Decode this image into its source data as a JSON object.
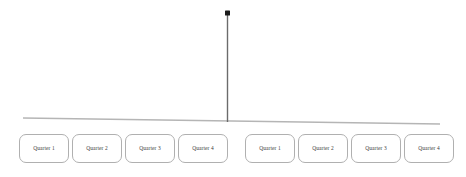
{
  "diagram": {
    "type": "timeline-hierarchy",
    "canvas": {
      "width": 466,
      "height": 177,
      "background": "#ffffff"
    },
    "root_marker": {
      "name": "root-node-marker",
      "shape": "square-dot",
      "color": "#1a1a1a",
      "x": 227.5,
      "y": 13,
      "size": 5
    },
    "stem": {
      "name": "vertical-connector",
      "color": "#6b6b6b",
      "width": 1.4,
      "x": 227.5,
      "y_top": 14,
      "y_bottom": 122
    },
    "baseline": {
      "name": "horizontal-baseline",
      "color": "#b5b5b5",
      "width": 1.4,
      "x_start": 23,
      "y_start": 118,
      "x_end": 440,
      "y_end": 124
    },
    "groups": [
      {
        "name": "left-quarter-group",
        "nodes": [
          {
            "label": "Quarter 1",
            "x": 19,
            "y": 134,
            "w": 50,
            "h": 29
          },
          {
            "label": "Quarter 2",
            "x": 72,
            "y": 134,
            "w": 50,
            "h": 29
          },
          {
            "label": "Quarter 3",
            "x": 125,
            "y": 134,
            "w": 50,
            "h": 29
          },
          {
            "label": "Quarter 4",
            "x": 178,
            "y": 134,
            "w": 50,
            "h": 29
          }
        ]
      },
      {
        "name": "right-quarter-group",
        "nodes": [
          {
            "label": "Quarter 1",
            "x": 245,
            "y": 134,
            "w": 50,
            "h": 29
          },
          {
            "label": "Quarter 2",
            "x": 298,
            "y": 134,
            "w": 50,
            "h": 29
          },
          {
            "label": "Quarter 3",
            "x": 351,
            "y": 134,
            "w": 50,
            "h": 29
          },
          {
            "label": "Quarter 4",
            "x": 404,
            "y": 134,
            "w": 50,
            "h": 29
          }
        ]
      }
    ]
  }
}
